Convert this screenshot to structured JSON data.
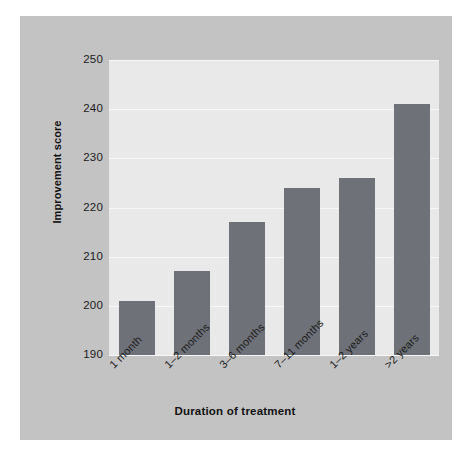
{
  "chart_data": {
    "type": "bar",
    "title": "",
    "xlabel": "Duration of treatment",
    "ylabel": "Improvement score",
    "categories": [
      "1 month",
      "1–2 months",
      "3–6 months",
      "7–11 months",
      "1–2 years",
      ">2 years"
    ],
    "values": [
      201,
      207,
      217,
      224,
      226,
      241
    ],
    "ylim": [
      190,
      250
    ],
    "yticks": [
      190,
      200,
      210,
      220,
      230,
      240,
      250
    ],
    "grid": true,
    "legend": "none",
    "bar_color": "#6e7278",
    "plot_background": "#e9e9e9",
    "figure_background": "#c3c3c3",
    "gridline_color": "#f7f7f7"
  }
}
